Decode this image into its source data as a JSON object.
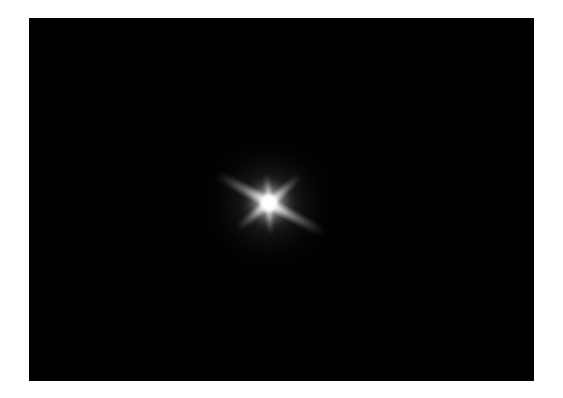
{
  "image": {
    "kind": "photograph",
    "subject": "bright star with six-point diffraction spikes",
    "alt_text": "A single bright white star on a black night sky, photographed with six diffraction spikes radiating from its core.",
    "canvas_width": 563,
    "canvas_height": 398,
    "background_color": "#ffffff"
  },
  "frame": {
    "name": "white photo border",
    "border_color": "#ffffff",
    "left_margin": 29,
    "top_margin": 18,
    "right_margin": 29,
    "bottom_margin": 17
  },
  "sky": {
    "label": "night sky field",
    "color": "#000000",
    "x": 29,
    "y": 18,
    "width": 505,
    "height": 363
  },
  "star": {
    "label": "star",
    "core_color": "#ffffff",
    "glow_color": "#ffffff",
    "center_x": 269,
    "center_y": 203,
    "center_x_in_field": 240,
    "center_y_in_field": 185,
    "core_radius": 11,
    "spike_count": 6,
    "spikes": [
      {
        "name": "upper-left-spike",
        "direction": "nw",
        "angle_deg": 208,
        "length": 62
      },
      {
        "name": "lower-right-spike",
        "direction": "se",
        "angle_deg": 28,
        "length": 66
      },
      {
        "name": "upper-right-spike",
        "direction": "ne",
        "angle_deg": 318,
        "length": 44
      },
      {
        "name": "lower-left-spike",
        "direction": "sw",
        "angle_deg": 140,
        "length": 42
      },
      {
        "name": "upper-spike",
        "direction": "up",
        "angle_deg": 264,
        "length": 30
      },
      {
        "name": "lower-spike",
        "direction": "down",
        "angle_deg": 86,
        "length": 32
      }
    ]
  }
}
